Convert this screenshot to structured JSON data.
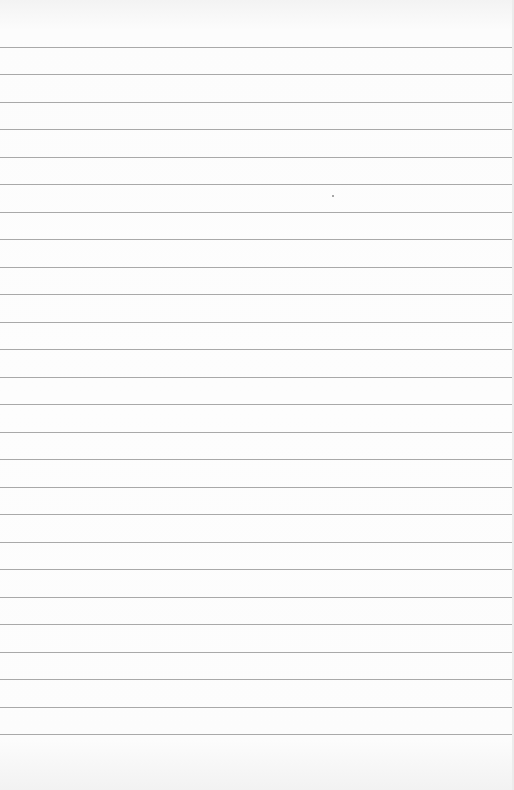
{
  "page": {
    "type": "lined-paper",
    "background_color": "#fcfcfc",
    "rule_color": "#a9a9a9",
    "rule_count": 26,
    "first_rule_y": 47,
    "rule_spacing": 27.48,
    "content_text": ""
  }
}
